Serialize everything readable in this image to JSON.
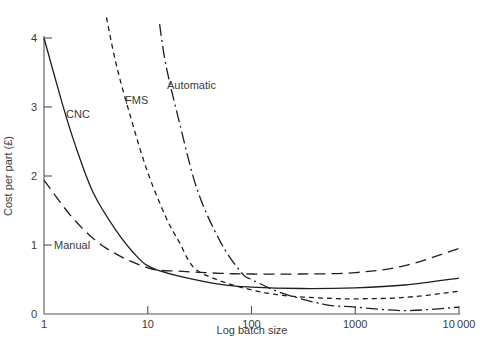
{
  "chart_data": {
    "type": "line",
    "title": "",
    "xlabel": "Log batch size",
    "ylabel": "Cost per part (£)",
    "xscale": "log",
    "xlim": [
      1,
      10000
    ],
    "ylim": [
      0,
      4
    ],
    "grid": false,
    "legend": "inline labels",
    "x_ticks": [
      "1",
      "10",
      "100",
      "1000",
      "10000"
    ],
    "y_ticks": [
      "0",
      "1",
      "2",
      "3",
      "4"
    ],
    "series": [
      {
        "name": "Manual",
        "style": "long-dash",
        "x": [
          1,
          2,
          4,
          10,
          20,
          50,
          100,
          300,
          1000,
          3000,
          10000
        ],
        "y": [
          1.94,
          1.35,
          0.95,
          0.67,
          0.62,
          0.59,
          0.58,
          0.58,
          0.6,
          0.7,
          0.95
        ]
      },
      {
        "name": "CNC",
        "style": "solid",
        "x": [
          1,
          1.5,
          2,
          3,
          5,
          8,
          11,
          20,
          50,
          100,
          300,
          1000,
          3000,
          10000
        ],
        "y": [
          4.0,
          3.05,
          2.45,
          1.75,
          1.2,
          0.82,
          0.67,
          0.55,
          0.43,
          0.39,
          0.37,
          0.38,
          0.42,
          0.52
        ]
      },
      {
        "name": "FMS",
        "style": "short-dash",
        "x": [
          4,
          5,
          7,
          10,
          15,
          20,
          28,
          50,
          100,
          200,
          500,
          1000,
          3000,
          10000
        ],
        "y": [
          4.3,
          3.6,
          2.8,
          2.05,
          1.4,
          1.05,
          0.67,
          0.48,
          0.35,
          0.27,
          0.23,
          0.22,
          0.24,
          0.33
        ]
      },
      {
        "name": "Automatic",
        "style": "dash-dot",
        "x": [
          13,
          15,
          20,
          30,
          50,
          80,
          100,
          200,
          500,
          1000,
          3000,
          10000
        ],
        "y": [
          4.2,
          3.6,
          2.8,
          1.8,
          1.05,
          0.6,
          0.5,
          0.3,
          0.14,
          0.1,
          0.05,
          0.1
        ]
      }
    ],
    "labels": [
      {
        "text": "CNC",
        "near_series": "CNC"
      },
      {
        "text": "FMS",
        "near_series": "FMS"
      },
      {
        "text": "Automatic",
        "near_series": "Automatic"
      },
      {
        "text": "Manual",
        "near_series": "Manual"
      }
    ]
  }
}
